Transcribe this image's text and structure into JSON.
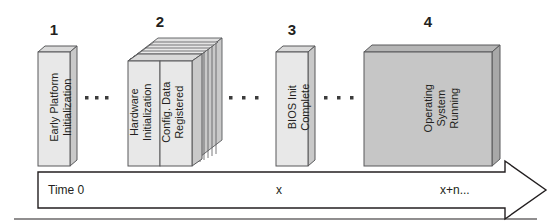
{
  "diagram": {
    "colors": {
      "stroke": "#58595b",
      "stroke_dark": "#231f20",
      "box_light_fill": "#e8e8e8",
      "box_light_top": "#d9d9d9",
      "box_light_side": "#c9c9c9",
      "box_dark_fill": "#c6c6c6",
      "box_dark_top": "#b5b5b5",
      "box_dark_side": "#a8a8a8",
      "text": "#231f20",
      "dot": "#3c3c3c"
    },
    "steps": [
      {
        "number": "1",
        "label_lines": [
          "Early Platform",
          "Initialization"
        ],
        "style": "single-light"
      },
      {
        "number": "2",
        "label_lines": [
          "Hardware",
          "Initialization"
        ],
        "second_panel_lines": [
          "Config. Data",
          "Registered"
        ],
        "style": "stacked-light"
      },
      {
        "number": "3",
        "label_lines": [
          "BIOS Init",
          "Complete"
        ],
        "style": "single-light"
      },
      {
        "number": "4",
        "label_lines": [
          "Operating",
          "System",
          "Running"
        ],
        "style": "single-dark"
      }
    ],
    "separators": [
      {
        "name": "ellipsis-1",
        "dots": 3
      },
      {
        "name": "ellipsis-2",
        "dots": 3
      },
      {
        "name": "ellipsis-3",
        "dots": 3
      }
    ],
    "timeline": {
      "name": "time-axis-arrow",
      "ticks": [
        {
          "key": "start",
          "label": "Time 0"
        },
        {
          "key": "middle",
          "label": "x"
        },
        {
          "key": "end",
          "label": "x+n..."
        }
      ]
    }
  }
}
